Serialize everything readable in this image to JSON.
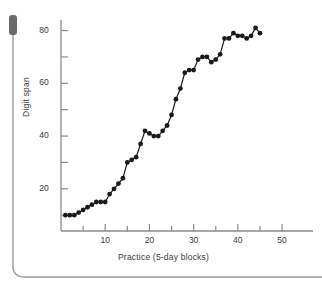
{
  "figure": {
    "name": "digit-span-practice-line-chart",
    "background": "#ffffff",
    "ink_color": "#1a1a1a",
    "axis_color": "#8a8a8a",
    "text_color": "#3a3a3a"
  },
  "artifacts": {
    "top_left_bar_label": "scan-shadow-bar",
    "page_edge_label": "page-edge-line"
  },
  "chart_data": {
    "type": "line",
    "title": "",
    "subtitle": "",
    "xlabel": "Practice (5-day blocks)",
    "ylabel": "Digit span",
    "xlim": [
      0,
      57
    ],
    "ylim": [
      4,
      84
    ],
    "grid": false,
    "legend": null,
    "markers": "filled-circle",
    "line_color": "#1a1a1a",
    "marker_color": "#1a1a1a",
    "xticks": [
      10,
      20,
      30,
      40,
      50
    ],
    "xtick_labels": [
      "10",
      "20",
      "30",
      "40",
      "50"
    ],
    "x_minor_ticks": [
      5,
      15,
      25,
      35,
      45
    ],
    "yticks": [
      20,
      40,
      60,
      80
    ],
    "ytick_labels": [
      "20",
      "40",
      "60",
      "80"
    ],
    "y_minor_ticks": [
      10,
      30,
      50,
      70
    ],
    "series": [
      {
        "name": "Digit span",
        "points": [
          {
            "x": 1,
            "y": 10
          },
          {
            "x": 2,
            "y": 10
          },
          {
            "x": 3,
            "y": 10
          },
          {
            "x": 4,
            "y": 11
          },
          {
            "x": 5,
            "y": 12
          },
          {
            "x": 6,
            "y": 13
          },
          {
            "x": 7,
            "y": 14
          },
          {
            "x": 8,
            "y": 15
          },
          {
            "x": 9,
            "y": 15
          },
          {
            "x": 10,
            "y": 15
          },
          {
            "x": 11,
            "y": 18
          },
          {
            "x": 12,
            "y": 20
          },
          {
            "x": 13,
            "y": 22
          },
          {
            "x": 14,
            "y": 24
          },
          {
            "x": 15,
            "y": 30
          },
          {
            "x": 16,
            "y": 31
          },
          {
            "x": 17,
            "y": 32
          },
          {
            "x": 18,
            "y": 37
          },
          {
            "x": 19,
            "y": 42
          },
          {
            "x": 20,
            "y": 41
          },
          {
            "x": 21,
            "y": 40
          },
          {
            "x": 22,
            "y": 40
          },
          {
            "x": 23,
            "y": 42
          },
          {
            "x": 24,
            "y": 44
          },
          {
            "x": 25,
            "y": 48
          },
          {
            "x": 26,
            "y": 54
          },
          {
            "x": 27,
            "y": 58
          },
          {
            "x": 28,
            "y": 64
          },
          {
            "x": 29,
            "y": 65
          },
          {
            "x": 30,
            "y": 65
          },
          {
            "x": 31,
            "y": 69
          },
          {
            "x": 32,
            "y": 70
          },
          {
            "x": 33,
            "y": 70
          },
          {
            "x": 34,
            "y": 68
          },
          {
            "x": 35,
            "y": 69
          },
          {
            "x": 36,
            "y": 71
          },
          {
            "x": 37,
            "y": 77
          },
          {
            "x": 38,
            "y": 77
          },
          {
            "x": 39,
            "y": 79
          },
          {
            "x": 40,
            "y": 78
          },
          {
            "x": 41,
            "y": 78
          },
          {
            "x": 42,
            "y": 77
          },
          {
            "x": 43,
            "y": 78
          },
          {
            "x": 44,
            "y": 81
          },
          {
            "x": 45,
            "y": 79
          }
        ]
      }
    ]
  }
}
